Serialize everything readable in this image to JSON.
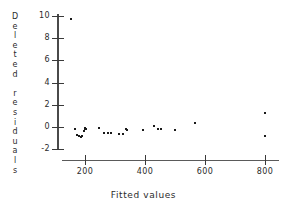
{
  "chart_data": {
    "type": "scatter",
    "title": "",
    "xlabel": "Fitted values",
    "ylabel": "Deleted residuals",
    "xlim": [
      120,
      840
    ],
    "ylim": [
      -2.6,
      10.4
    ],
    "grid": false,
    "legend": null,
    "xticks": [
      200,
      400,
      600,
      800
    ],
    "xtick_labels": [
      "200",
      "400",
      "600",
      "800"
    ],
    "yticks": [
      10,
      8,
      6,
      4,
      2,
      0,
      -2
    ],
    "ytick_labels": [
      "10",
      "8",
      "6",
      "4",
      "2",
      "0",
      "-2"
    ],
    "marker": "dot",
    "marker_color": "#1a1a1a",
    "points": [
      {
        "x": 152,
        "y": 9.7
      },
      {
        "x": 168,
        "y": -0.15
      },
      {
        "x": 172,
        "y": -0.75
      },
      {
        "x": 180,
        "y": -0.85
      },
      {
        "x": 186,
        "y": -0.9
      },
      {
        "x": 190,
        "y": -0.8
      },
      {
        "x": 196,
        "y": -0.35
      },
      {
        "x": 199,
        "y": -0.1
      },
      {
        "x": 201,
        "y": -0.2
      },
      {
        "x": 204,
        "y": -0.15
      },
      {
        "x": 248,
        "y": -0.1
      },
      {
        "x": 262,
        "y": -0.5
      },
      {
        "x": 276,
        "y": -0.5
      },
      {
        "x": 288,
        "y": -0.55
      },
      {
        "x": 312,
        "y": -0.6
      },
      {
        "x": 326,
        "y": -0.6
      },
      {
        "x": 336,
        "y": -0.15
      },
      {
        "x": 340,
        "y": -0.25
      },
      {
        "x": 392,
        "y": -0.3
      },
      {
        "x": 430,
        "y": 0.05
      },
      {
        "x": 444,
        "y": -0.2
      },
      {
        "x": 452,
        "y": -0.2
      },
      {
        "x": 500,
        "y": -0.3
      },
      {
        "x": 566,
        "y": 0.4
      },
      {
        "x": 800,
        "y": 1.25
      },
      {
        "x": 800,
        "y": -0.85
      }
    ]
  },
  "axis_titles": {
    "y_letters": [
      "D",
      "e",
      "l",
      "e",
      "t",
      "e",
      "d",
      "",
      "r",
      "e",
      "s",
      "i",
      "d",
      "u",
      "a",
      "l",
      "s"
    ],
    "x": "Fitted values"
  }
}
